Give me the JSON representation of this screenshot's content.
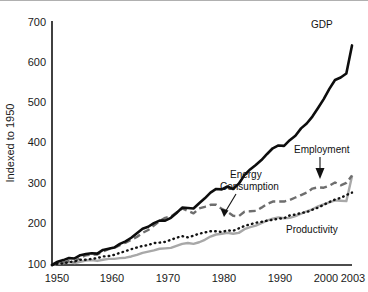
{
  "chart_data": {
    "type": "line",
    "title": "",
    "xlabel": "",
    "ylabel": "Indexed to 1950",
    "xlim": [
      1950,
      2003
    ],
    "ylim": [
      100,
      700
    ],
    "grid": false,
    "legend_position": "inline-annotations",
    "y_ticks": [
      "100",
      "200",
      "300",
      "400",
      "500",
      "600",
      "700"
    ],
    "x_ticks": [
      "1950",
      "1960",
      "1970",
      "1980",
      "1990",
      "2000",
      "2003"
    ],
    "annotations": [
      {
        "name": "gdp",
        "label": "GDP"
      },
      {
        "name": "energy",
        "label": "Energy Consumption"
      },
      {
        "name": "employment",
        "label": "Employment"
      },
      {
        "name": "productivity",
        "label": "Productivity"
      }
    ],
    "x": [
      1950,
      1951,
      1952,
      1953,
      1954,
      1955,
      1956,
      1957,
      1958,
      1959,
      1960,
      1961,
      1962,
      1963,
      1964,
      1965,
      1966,
      1967,
      1968,
      1969,
      1970,
      1971,
      1972,
      1973,
      1974,
      1975,
      1976,
      1977,
      1978,
      1979,
      1980,
      1981,
      1982,
      1983,
      1984,
      1985,
      1986,
      1987,
      1988,
      1989,
      1990,
      1991,
      1992,
      1993,
      1994,
      1995,
      1996,
      1997,
      1998,
      1999,
      2000,
      2001,
      2002,
      2003
    ],
    "series": [
      {
        "name": "GDP",
        "style": "solid-black-thick",
        "color": "#0d0d0d",
        "values": [
          100,
          108,
          112,
          117,
          116,
          124,
          127,
          129,
          128,
          137,
          140,
          143,
          152,
          158,
          167,
          178,
          189,
          194,
          203,
          209,
          209,
          216,
          228,
          241,
          240,
          239,
          252,
          264,
          278,
          287,
          286,
          293,
          287,
          300,
          321,
          335,
          346,
          358,
          373,
          387,
          394,
          393,
          407,
          418,
          436,
          448,
          465,
          486,
          508,
          533,
          555,
          561,
          571,
          640
        ]
      },
      {
        "name": "Energy Consumption",
        "style": "dashed-gray",
        "color": "#6e6e6e",
        "values": [
          100,
          104,
          106,
          110,
          108,
          118,
          124,
          126,
          126,
          133,
          139,
          142,
          149,
          155,
          162,
          169,
          179,
          186,
          197,
          208,
          216,
          219,
          229,
          239,
          233,
          227,
          239,
          243,
          248,
          248,
          238,
          231,
          221,
          220,
          231,
          232,
          233,
          241,
          250,
          256,
          256,
          256,
          260,
          266,
          272,
          278,
          288,
          291,
          290,
          295,
          303,
          296,
          302,
          320
        ]
      },
      {
        "name": "Employment",
        "style": "solid-gray",
        "color": "#a8a8a8",
        "values": [
          100,
          103,
          105,
          107,
          105,
          108,
          111,
          112,
          110,
          113,
          115,
          115,
          117,
          118,
          121,
          125,
          130,
          133,
          136,
          140,
          141,
          142,
          147,
          152,
          154,
          152,
          156,
          162,
          170,
          175,
          177,
          179,
          177,
          179,
          188,
          193,
          197,
          203,
          209,
          214,
          217,
          215,
          216,
          220,
          226,
          232,
          237,
          244,
          249,
          254,
          259,
          258,
          257,
          318
        ]
      },
      {
        "name": "Productivity",
        "style": "dotted-black",
        "color": "#121212",
        "values": [
          100,
          103,
          104,
          107,
          109,
          113,
          113,
          115,
          117,
          121,
          122,
          125,
          130,
          134,
          139,
          143,
          147,
          149,
          154,
          155,
          157,
          162,
          167,
          171,
          168,
          172,
          177,
          180,
          183,
          183,
          181,
          185,
          184,
          190,
          196,
          200,
          204,
          206,
          209,
          211,
          214,
          215,
          222,
          224,
          228,
          230,
          236,
          241,
          248,
          255,
          261,
          265,
          272,
          278
        ]
      }
    ]
  }
}
